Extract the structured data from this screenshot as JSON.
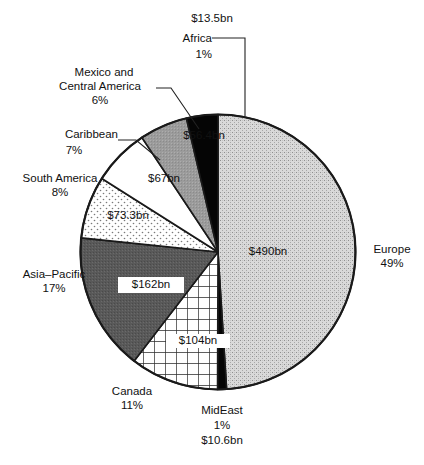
{
  "chart_data": {
    "type": "pie",
    "title": "",
    "subtitle": "",
    "xlabel": "",
    "ylabel": "",
    "legend_position": "none",
    "grid": false,
    "value_unit": "bn",
    "value_prefix": "$",
    "categories": [
      "Europe",
      "MidEast",
      "Canada",
      "Asia–Pacific",
      "South America",
      "Caribbean",
      "Mexico and Central America",
      "Africa"
    ],
    "values": [
      490,
      10.6,
      104,
      162,
      73.3,
      67,
      56.4,
      13.5
    ],
    "percents": [
      49,
      1,
      11,
      17,
      8,
      7,
      6,
      1
    ],
    "slices": [
      {
        "name": "Europe",
        "value_label": "$490bn",
        "percent_label": "49%",
        "name_label": "Europe",
        "fill": "speckle-light",
        "start_deg": 0,
        "end_deg": 176.4
      },
      {
        "name": "MidEast",
        "value_label": "$10.6bn",
        "percent_label": "1%",
        "name_label": "MidEast",
        "fill": "solid-black",
        "start_deg": 176.4,
        "end_deg": 180.2
      },
      {
        "name": "Canada",
        "value_label": "$104bn",
        "percent_label": "11%",
        "name_label": "Canada",
        "fill": "grid",
        "start_deg": 180.2,
        "end_deg": 217.6
      },
      {
        "name": "Asia–Pacific",
        "value_label": "$162bn",
        "percent_label": "17%",
        "name_label": "Asia–Pacific",
        "fill": "solid-darkgray",
        "start_deg": 217.6,
        "end_deg": 275.9
      },
      {
        "name": "South America",
        "value_label": "$73.3bn",
        "percent_label": "8%",
        "name_label": "South America",
        "fill": "dots",
        "start_deg": 275.9,
        "end_deg": 302.3
      },
      {
        "name": "Caribbean",
        "value_label": "$67bn",
        "percent_label": "7%",
        "name_label": "Caribbean",
        "fill": "white",
        "start_deg": 302.3,
        "end_deg": 326.4
      },
      {
        "name": "Mexico and Central America",
        "value_label": "$56.4bn",
        "percent_label": "6%",
        "name_label": "Mexico and\nCentral America",
        "fill": "solid-midgray",
        "start_deg": 326.4,
        "end_deg": 346.7
      },
      {
        "name": "Africa",
        "value_label": "$13.5bn",
        "percent_label": "1%",
        "name_label": "Africa",
        "fill": "solid-black",
        "start_deg": 346.7,
        "end_deg": 360
      }
    ]
  },
  "labels": {
    "africa_value": "$13.5bn",
    "africa_name": "Africa",
    "africa_percent": "1%",
    "mexico_name_line1": "Mexico and",
    "mexico_name_line2": "Central America",
    "mexico_percent": "6%",
    "mexico_value": "$56.4bn",
    "caribbean_name": "Caribbean",
    "caribbean_percent": "7%",
    "caribbean_value": "$67bn",
    "south_america_name": "South America",
    "south_america_percent": "8%",
    "south_america_value": "$73.3bn",
    "asia_pacific_name": "Asia–Pacific",
    "asia_pacific_percent": "17%",
    "asia_pacific_value": "$162bn",
    "canada_name": "Canada",
    "canada_percent": "11%",
    "canada_value": "$104bn",
    "mideast_name": "MidEast",
    "mideast_percent": "1%",
    "mideast_value": "$10.6bn",
    "europe_name": "Europe",
    "europe_percent": "49%",
    "europe_value": "$490bn"
  },
  "colors": {
    "outline": "#1a1a1a",
    "black_slice": "#050505",
    "dark_gray_slice": "#595959",
    "mid_gray_slice": "#9a9a9a",
    "light_speckle_slice": "#d6d6d6",
    "white_slice": "#ffffff",
    "text": "#111111",
    "background": "#ffffff"
  }
}
